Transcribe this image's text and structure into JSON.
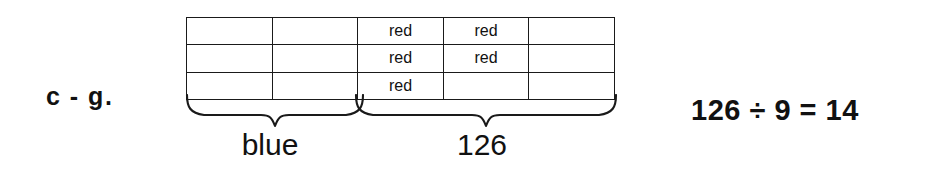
{
  "figure": {
    "problem_label": "c - g.",
    "background_color": "#ffffff",
    "line_color": "#1a1a1a",
    "text_color": "#111111"
  },
  "grid": {
    "columns": 5,
    "rows": 3,
    "cells": [
      [
        "",
        "",
        "red",
        "red",
        ""
      ],
      [
        "",
        "",
        "red",
        "red",
        ""
      ],
      [
        "",
        "",
        "red",
        "",
        ""
      ]
    ]
  },
  "braces": [
    {
      "name": "blue",
      "label": "blue",
      "span_columns": 2,
      "width": 178
    },
    {
      "name": "126",
      "label": "126",
      "span_columns": 3,
      "width": 262
    }
  ],
  "equations": {
    "line_1": "126 ÷ 9 = 14",
    "line_2": "14 × 5 = 70"
  }
}
